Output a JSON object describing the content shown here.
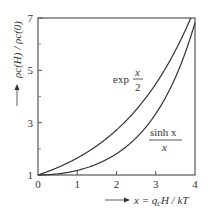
{
  "chart_data": {
    "type": "line",
    "title": "",
    "xlabel": "x = q_c H / kT",
    "ylabel": "ρ_c(H) / ρ_c(0)",
    "xlim": [
      0,
      4
    ],
    "ylim": [
      1,
      7
    ],
    "x_ticks": [
      "0",
      "1",
      "2",
      "3",
      "4"
    ],
    "y_ticks": [
      "1",
      "3",
      "5",
      "7"
    ],
    "y_minor_ticks": [
      2,
      4,
      6
    ],
    "grid": false,
    "legend": "inline curve labels",
    "series": [
      {
        "name": "exp x/2",
        "label_main": "exp",
        "label_num": "x",
        "label_den": "2",
        "x": [
          0,
          0.5,
          1,
          1.5,
          2,
          2.5,
          3,
          3.5,
          3.89
        ],
        "values": [
          1.0,
          1.28,
          1.65,
          2.12,
          2.72,
          3.49,
          4.48,
          5.75,
          7.0
        ]
      },
      {
        "name": "sinh x / x",
        "label_num": "sinh x",
        "label_den": "x",
        "x": [
          0,
          0.5,
          1,
          1.5,
          2,
          2.5,
          3,
          3.5,
          4
        ],
        "values": [
          1.0,
          1.04,
          1.18,
          1.42,
          1.81,
          2.42,
          3.34,
          4.73,
          6.82
        ]
      }
    ]
  },
  "labels": {
    "x_axis_prefix": "x = q",
    "x_axis_sub": "c",
    "x_axis_suffix": "H / kT",
    "y_axis_text": "ρc(H) / ρc(0)",
    "arrow": "→"
  }
}
